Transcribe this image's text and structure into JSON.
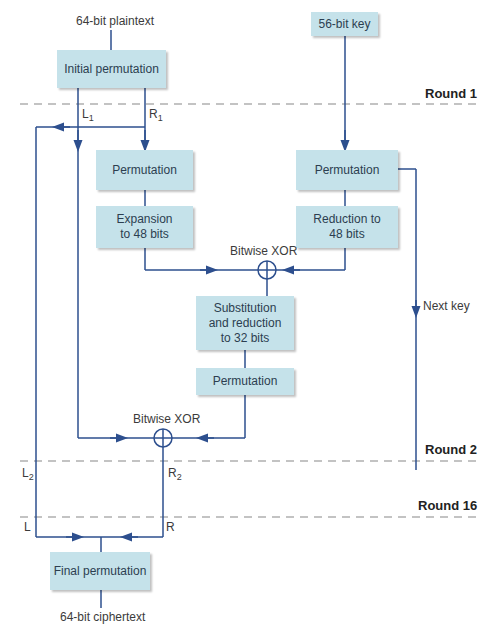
{
  "diagram": {
    "inputs": {
      "plaintext": "64-bit plaintext",
      "key": "56-bit key"
    },
    "output": {
      "ciphertext": "64-bit ciphertext"
    },
    "boxes": {
      "initial_permutation": "Initial permutation",
      "permutation_right": "Permutation",
      "expansion": "Expansion to 48 bits",
      "key_permutation": "Permutation",
      "key_reduction": "Reduction to 48 bits",
      "substitution": "Substitution and reduction to 32 bits",
      "permutation_after_sub": "Permutation",
      "final_permutation": "Final permutation"
    },
    "xor_labels": {
      "first": "Bitwise XOR",
      "second": "Bitwise XOR"
    },
    "next_key": "Next key",
    "rounds": {
      "r1": "Round 1",
      "r2": "Round 2",
      "r16": "Round 16"
    },
    "halves": {
      "l1": "L",
      "l1_sub": "1",
      "r1": "R",
      "r1_sub": "1",
      "l2": "L",
      "l2_sub": "2",
      "r2": "R",
      "r2_sub": "2",
      "l": "L",
      "r": "R"
    },
    "colors": {
      "line": "#2d4f8e",
      "box": "#c5e2ea",
      "dash": "#888888"
    }
  }
}
